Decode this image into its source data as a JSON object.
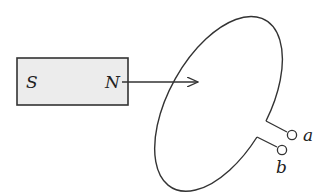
{
  "diagram": {
    "magnet": {
      "south_label": "S",
      "north_label": "N",
      "fill": "#ececec",
      "stroke": "#333333"
    },
    "arrow": {
      "direction": "right",
      "meaning": "magnet motion toward loop"
    },
    "loop": {
      "shape": "tilted ellipse",
      "stroke": "#333333"
    },
    "terminals": [
      {
        "label": "a"
      },
      {
        "label": "b"
      }
    ]
  }
}
